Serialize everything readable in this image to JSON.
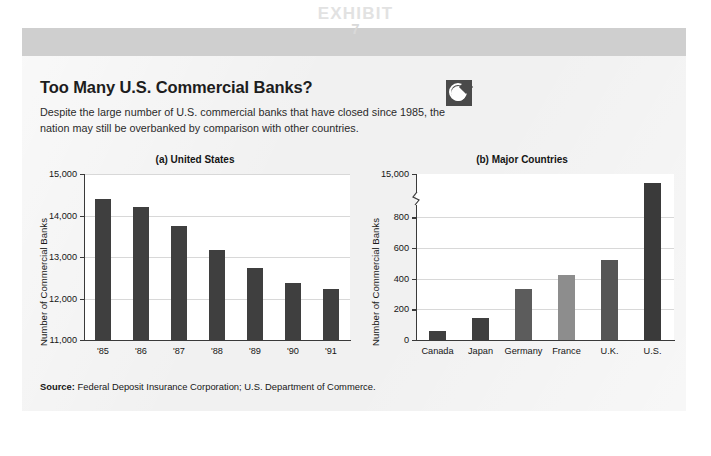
{
  "exhibit": {
    "word": "EXHIBIT",
    "number": "7"
  },
  "heading": {
    "title": "Too Many U.S. Commercial Banks?",
    "subtitle": "Despite the large number of U.S. commercial banks that have closed since 1985, the nation may still be overbanked by comparison with other countries.",
    "badge_icon": "globe-icon"
  },
  "source": {
    "label": "Source:",
    "text": " Federal Deposit Insurance Corporation; U.S. Department of Commerce."
  },
  "colors": {
    "bar_dark": "#3f3f3f",
    "bar_light": "#8d8d8d",
    "band": "#cfcfcf",
    "card": "#f1f1f1",
    "grid": "#d8d8d8",
    "axis": "#3a3a3a"
  },
  "chart_data": [
    {
      "type": "bar",
      "title": "(a) United States",
      "xlabel": "",
      "ylabel": "Number of Commercial Banks",
      "categories": [
        "'85",
        "'86",
        "'87",
        "'88",
        "'89",
        "'90",
        "'91"
      ],
      "values": [
        14400,
        14200,
        13740,
        13180,
        12740,
        12380,
        12220
      ],
      "ylim": [
        11000,
        15000
      ],
      "yticks": [
        11000,
        12000,
        13000,
        14000,
        15000
      ],
      "ytick_labels": [
        "11,000",
        "12,000",
        "13,000",
        "14,000",
        "15,000"
      ],
      "bar_colors": [
        "#3f3f3f",
        "#3f3f3f",
        "#3f3f3f",
        "#3f3f3f",
        "#3f3f3f",
        "#3f3f3f",
        "#3f3f3f"
      ],
      "grid": true,
      "legend": "none",
      "axis_break": false
    },
    {
      "type": "bar",
      "title": "(b) Major Countries",
      "xlabel": "",
      "ylabel": "Number of Commercial Banks",
      "categories": [
        "Canada",
        "Japan",
        "Germany",
        "France",
        "U.K.",
        "U.S."
      ],
      "values": [
        62,
        145,
        335,
        425,
        520,
        15000
      ],
      "ylim": [
        0,
        900
      ],
      "yticks": [
        0,
        200,
        400,
        600,
        800
      ],
      "ytick_labels": [
        "0",
        "200",
        "400",
        "600",
        "800"
      ],
      "top_tick_value": 15000,
      "top_tick_label": "15,000",
      "bar_colors": [
        "#3f3f3f",
        "#3f3f3f",
        "#5c5c5c",
        "#8d8d8d",
        "#555555",
        "#3a3a3a"
      ],
      "grid": true,
      "legend": "none",
      "axis_break": true,
      "axis_break_note": "y-axis broken between 800 and 15,000"
    }
  ]
}
